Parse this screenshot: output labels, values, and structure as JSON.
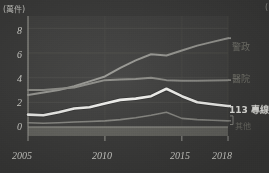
{
  "figure": {
    "unit_label": "(萬件)",
    "corner_mark": "(",
    "background_color": "#3b3b3a"
  },
  "axes": {
    "y_ticks": [
      "8",
      "6",
      "4",
      "2",
      "0"
    ],
    "x_ticks": [
      "2005",
      "2010",
      "2015",
      "2018"
    ]
  },
  "series_labels": {
    "police": "警政",
    "hospital": "醫院",
    "hotline": "113 專線",
    "other": "其他"
  },
  "chart_data": {
    "type": "line",
    "title": "",
    "xlabel": "",
    "ylabel": "萬件",
    "unit": "萬件",
    "xlim": [
      2005,
      2018
    ],
    "ylim": [
      0,
      9
    ],
    "y_ticks": [
      0,
      2,
      4,
      6,
      8
    ],
    "x_ticks": [
      2005,
      2010,
      2015,
      2018
    ],
    "grid": "horizontal-and-vertical",
    "legend_position": "right-inline",
    "x": [
      2005,
      2006,
      2007,
      2008,
      2009,
      2010,
      2011,
      2012,
      2013,
      2014,
      2015,
      2016,
      2017,
      2018
    ],
    "series": [
      {
        "name": "警政",
        "color": "#9a9a95",
        "width": 2.0,
        "values": [
          2.6,
          2.8,
          3.0,
          3.3,
          3.7,
          4.1,
          4.8,
          5.4,
          5.9,
          5.8,
          6.2,
          6.6,
          6.9,
          7.2
        ]
      },
      {
        "name": "醫院",
        "color": "#8e8e89",
        "width": 2.0,
        "values": [
          3.0,
          3.0,
          3.1,
          3.2,
          3.5,
          3.8,
          3.85,
          3.9,
          4.0,
          3.8,
          3.75,
          3.75,
          3.78,
          3.8
        ]
      },
      {
        "name": "113 專線",
        "color": "#f2f2ef",
        "width": 2.6,
        "values": [
          1.0,
          0.95,
          1.2,
          1.5,
          1.6,
          1.9,
          2.2,
          2.3,
          2.5,
          3.1,
          2.5,
          2.0,
          1.85,
          1.7
        ]
      },
      {
        "name": "其他",
        "color": "#8a8a85",
        "width": 1.6,
        "values": [
          0.35,
          0.3,
          0.35,
          0.4,
          0.45,
          0.5,
          0.6,
          0.75,
          0.95,
          1.2,
          0.7,
          0.6,
          0.55,
          0.5
        ]
      }
    ]
  }
}
